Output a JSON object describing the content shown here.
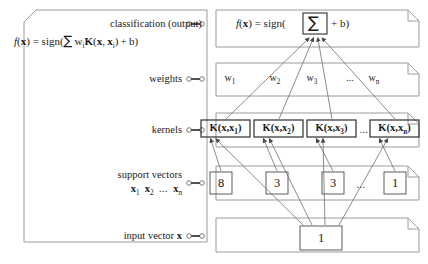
{
  "diagram": {
    "left_panel": {
      "formula_main": "f(x) = sign(∑ wᵢK(x, xᵢ) + b)",
      "rows": [
        {
          "name": "classification",
          "label": "classification (output)"
        },
        {
          "name": "weights",
          "label": "weights"
        },
        {
          "name": "kernels",
          "label": "kernels"
        },
        {
          "name": "support-vectors",
          "label": "support vectors",
          "sublabel": "x₁ x₂ ... xₙ"
        },
        {
          "name": "input-vector",
          "label": "input vector x"
        }
      ]
    },
    "right_panel": {
      "output_row": {
        "prefix": "f(x) = sign(",
        "sigma": "∑",
        "suffix": "+ b)"
      },
      "weights_row": {
        "items": [
          "w₁",
          "w₂",
          "w₃",
          "...",
          "wₙ"
        ]
      },
      "kernels_row": {
        "items": [
          "K(x,x₁)",
          "K(x,x₂)",
          "K(x,x₃)",
          "...",
          "K(x,xₙ)"
        ]
      },
      "support_vectors_row": {
        "items": [
          "8",
          "3",
          "3",
          "...",
          "1"
        ]
      },
      "input_row": {
        "items": [
          "1"
        ]
      }
    },
    "colors": {
      "line": "#8a8a8a",
      "box_border": "#3c3c3c",
      "text": "#1a1a1a",
      "background": "#ffffff"
    }
  }
}
